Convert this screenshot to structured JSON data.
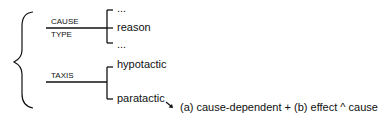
{
  "diagram": {
    "system1": {
      "label_top": "CAUSE",
      "label_bottom": "TYPE",
      "options": [
        "...",
        "reason",
        "..."
      ]
    },
    "system2": {
      "label": "TAXIS",
      "options": [
        "hypotactic",
        "paratactic"
      ]
    },
    "realization": "(a) cause-dependent + (b) effect ^ cause"
  }
}
